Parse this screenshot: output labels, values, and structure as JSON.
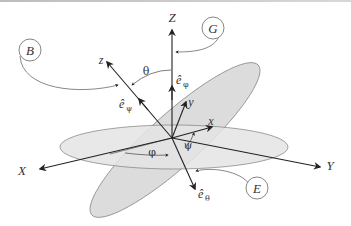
{
  "diagram": {
    "axes": {
      "fixed": {
        "X": "X",
        "Y": "Y",
        "Z": "Z"
      },
      "body": {
        "x": "x",
        "y": "y",
        "z": "z"
      }
    },
    "angles": {
      "phi": "φ",
      "theta": "θ",
      "psi": "ψ"
    },
    "unit_vectors": {
      "e_phi": {
        "base": "ê",
        "sub": "φ"
      },
      "e_psi": {
        "base": "ê",
        "sub": "ψ"
      },
      "e_theta": {
        "base": "ê",
        "sub": "θ"
      }
    },
    "callouts": [
      {
        "id": "B",
        "label": "B"
      },
      {
        "id": "G",
        "label": "G"
      },
      {
        "id": "E",
        "label": "E"
      }
    ],
    "colors": {
      "plane_fill": "#dcdcdc",
      "plane_stroke": "#8a8a8a",
      "axis": "#2a2a2a",
      "callout_stroke": "#666666"
    }
  }
}
